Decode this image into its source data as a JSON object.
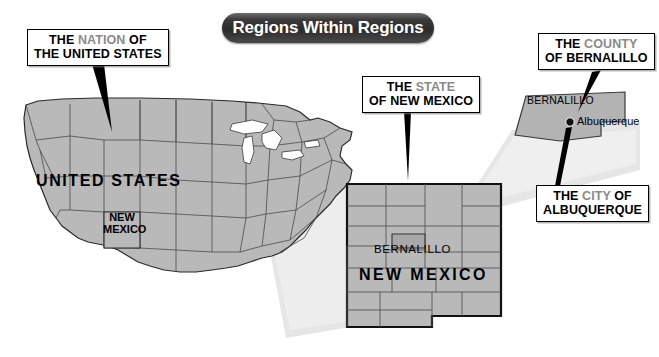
{
  "title": {
    "text": "Regions Within Regions"
  },
  "callouts": [
    {
      "id": "nation",
      "line1_a": "THE ",
      "line1_b": "NATION",
      "line1_c": " OF",
      "line2": "THE UNITED STATES"
    },
    {
      "id": "state",
      "line1_a": "THE ",
      "line1_b": "STATE",
      "line1_c": "",
      "line2": "OF NEW MEXICO"
    },
    {
      "id": "county",
      "line1_a": "THE ",
      "line1_b": "COUNTY",
      "line1_c": "",
      "line2": "OF BERNALILLO"
    },
    {
      "id": "city",
      "line1_a": "THE ",
      "line1_b": "CITY",
      "line1_c": " OF",
      "line2": "ALBUQUERQUE"
    }
  ],
  "map_labels": {
    "united_states": "UNITED STATES",
    "new_mexico_in_us_line1": "NEW",
    "new_mexico_in_us_line2": "MEXICO",
    "bernalillo_in_nm": "BERNALILLO",
    "new_mexico_big": "NEW MEXICO",
    "bernalillo_county": "BERNALILLO",
    "albuquerque_city": "Albuquerque"
  },
  "colors": {
    "map_fill": "#b9b9b9",
    "map_border": "#2a2a2a",
    "county_border": "#333333",
    "lake_fill": "#ffffff",
    "highlight_text": "#8a8a8a",
    "cone_fill": "#e3e3e3",
    "title_bg": "#2b2b2b",
    "title_text": "#ffffff",
    "pointer": "#000000"
  },
  "icons": {
    "city_marker": "city-dot-marker"
  }
}
